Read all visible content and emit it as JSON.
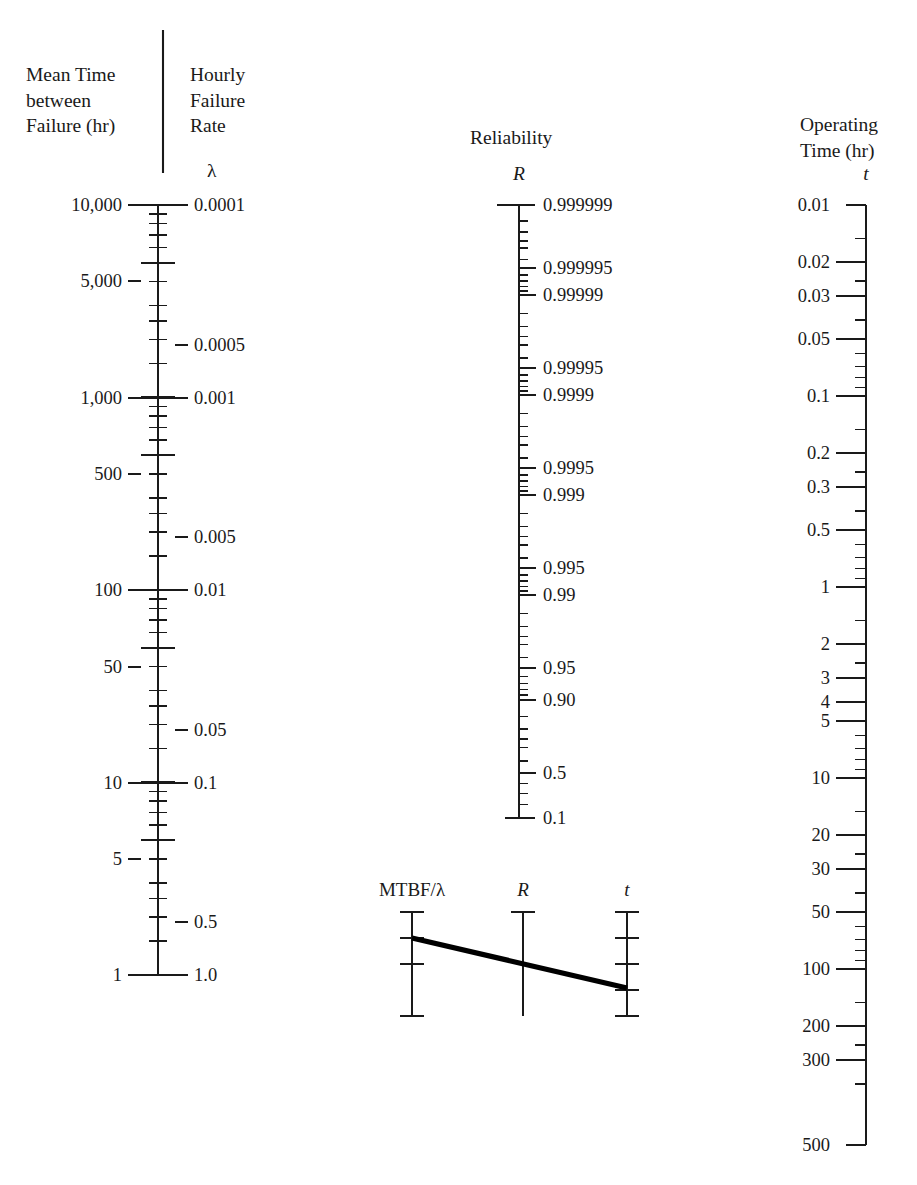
{
  "figure": {
    "type": "nomogram"
  },
  "headers": {
    "mtbf": "Mean Time\nbetween\nFailure (hr)",
    "failure_rate": "Hourly\nFailure\nRate",
    "reliability": "Reliability",
    "operating_time": "Operating\nTime (hr)"
  },
  "symbols": {
    "lambda": "λ",
    "reliability": "R",
    "time": "t"
  },
  "chart_data": {
    "type": "nomogram",
    "scales": [
      {
        "name": "mtbf",
        "label": "Mean Time between Failure (hr)",
        "symbol": "",
        "side": "left",
        "axis_x": 158,
        "y_top": 205,
        "y_bottom": 975,
        "scale": "log-reversed",
        "domain": [
          10000,
          1
        ],
        "labeled_ticks": [
          {
            "value": 10000,
            "text": "10,000",
            "y": 205
          },
          {
            "value": 5000,
            "text": "5,000",
            "y": 281
          },
          {
            "value": 1000,
            "text": "1,000",
            "y": 398
          },
          {
            "value": 500,
            "text": "500",
            "y": 474
          },
          {
            "value": 100,
            "text": "100",
            "y": 590
          },
          {
            "value": 50,
            "text": "50",
            "y": 667
          },
          {
            "value": 10,
            "text": "10",
            "y": 783
          },
          {
            "value": 5,
            "text": "5",
            "y": 859
          },
          {
            "value": 1,
            "text": "1",
            "y": 975
          }
        ]
      },
      {
        "name": "failure_rate",
        "label": "Hourly Failure Rate",
        "symbol": "λ",
        "side": "right",
        "axis_x": 158,
        "scale": "log",
        "domain": [
          0.0001,
          1.0
        ],
        "labeled_ticks": [
          {
            "value": 0.0001,
            "text": "0.0001",
            "y": 205
          },
          {
            "value": 0.0005,
            "text": "0.0005",
            "y": 345
          },
          {
            "value": 0.001,
            "text": "0.001",
            "y": 398
          },
          {
            "value": 0.005,
            "text": "0.005",
            "y": 537
          },
          {
            "value": 0.01,
            "text": "0.01",
            "y": 590
          },
          {
            "value": 0.05,
            "text": "0.05",
            "y": 730
          },
          {
            "value": 0.1,
            "text": "0.1",
            "y": 783
          },
          {
            "value": 0.5,
            "text": "0.5",
            "y": 922
          },
          {
            "value": 1.0,
            "text": "1.0",
            "y": 975
          }
        ]
      },
      {
        "name": "reliability",
        "label": "Reliability",
        "symbol": "R",
        "side": "right",
        "axis_x": 519,
        "y_top": 205,
        "y_bottom": 818,
        "scale": "log-log-reliability",
        "domain": [
          0.999999,
          0.1
        ],
        "labeled_ticks": [
          {
            "value": 0.999999,
            "text": "0.999999",
            "y": 205
          },
          {
            "value": 0.999995,
            "text": "0.999995",
            "y": 268
          },
          {
            "value": 0.99999,
            "text": "0.99999",
            "y": 295
          },
          {
            "value": 0.99995,
            "text": "0.99995",
            "y": 368
          },
          {
            "value": 0.9999,
            "text": "0.9999",
            "y": 395
          },
          {
            "value": 0.9995,
            "text": "0.9995",
            "y": 468
          },
          {
            "value": 0.999,
            "text": "0.999",
            "y": 495
          },
          {
            "value": 0.995,
            "text": "0.995",
            "y": 568
          },
          {
            "value": 0.99,
            "text": "0.99",
            "y": 595
          },
          {
            "value": 0.95,
            "text": "0.95",
            "y": 668
          },
          {
            "value": 0.9,
            "text": "0.90",
            "y": 700
          },
          {
            "value": 0.5,
            "text": "0.5",
            "y": 773
          },
          {
            "value": 0.1,
            "text": "0.1",
            "y": 818
          }
        ]
      },
      {
        "name": "operating_time",
        "label": "Operating Time (hr)",
        "symbol": "t",
        "side": "left",
        "axis_x": 866,
        "y_top": 205,
        "y_bottom": 1145,
        "scale": "log",
        "domain": [
          0.01,
          500
        ],
        "labeled_ticks": [
          {
            "value": 0.01,
            "text": "0.01",
            "y": 205
          },
          {
            "value": 0.02,
            "text": "0.02",
            "y": 262
          },
          {
            "value": 0.03,
            "text": "0.03",
            "y": 296
          },
          {
            "value": 0.05,
            "text": "0.05",
            "y": 339
          },
          {
            "value": 0.1,
            "text": "0.1",
            "y": 396
          },
          {
            "value": 0.2,
            "text": "0.2",
            "y": 453
          },
          {
            "value": 0.3,
            "text": "0.3",
            "y": 487
          },
          {
            "value": 0.5,
            "text": "0.5",
            "y": 530
          },
          {
            "value": 1,
            "text": "1",
            "y": 587
          },
          {
            "value": 2,
            "text": "2",
            "y": 644
          },
          {
            "value": 3,
            "text": "3",
            "y": 678
          },
          {
            "value": 4,
            "text": "4",
            "y": 702
          },
          {
            "value": 5,
            "text": "5",
            "y": 721
          },
          {
            "value": 10,
            "text": "10",
            "y": 778
          },
          {
            "value": 20,
            "text": "20",
            "y": 835
          },
          {
            "value": 30,
            "text": "30",
            "y": 869
          },
          {
            "value": 50,
            "text": "50",
            "y": 912
          },
          {
            "value": 100,
            "text": "100",
            "y": 969
          },
          {
            "value": 200,
            "text": "200",
            "y": 1026
          },
          {
            "value": 300,
            "text": "300",
            "y": 1060
          },
          {
            "value": 500,
            "text": "500",
            "y": 1145
          }
        ]
      }
    ],
    "inset": {
      "caption_labels": [
        "MTBF/λ",
        "R",
        "t"
      ],
      "axes_x": [
        412,
        523,
        627
      ],
      "axis_y_top": 912,
      "axis_y_bottom": 1016,
      "isopleth": {
        "description": "straight line crossing the three scales",
        "from": [
          412,
          938
        ],
        "to": [
          627,
          988
        ]
      }
    }
  },
  "colors": {
    "ink": "#1a1a1a",
    "background": "#ffffff",
    "isopleth": "#000000"
  }
}
